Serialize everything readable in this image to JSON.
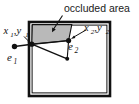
{
  "figure": {
    "title": "occluded area",
    "kind": "geometry-diagram",
    "width": 139,
    "height": 104
  },
  "colors": {
    "background": "#ffffff",
    "outline": "#111111",
    "box_stroke": "#111111",
    "occluded_fill": "#b9b9b9",
    "occluded_stroke": "#111111",
    "marker_fill": "#111111",
    "text": "#1a1a1a"
  },
  "annotations": {
    "callout": {
      "text": "occluded area",
      "points_to": "occluded-region"
    }
  },
  "labels": {
    "x1y1": {
      "base": "x",
      "sub1": "1",
      "mid": ",y",
      "sub2": "1",
      "full": "x1,y1"
    },
    "x2y2": {
      "base": "x",
      "sub1": "2",
      "mid": ",y",
      "sub2": "2",
      "full": "x2,y2"
    },
    "e1": {
      "base": "e",
      "sub": "1",
      "full": "e1"
    },
    "e2": {
      "base": "e",
      "sub": "2",
      "full": "e2"
    }
  },
  "points": {
    "e1": {
      "x": 14.5,
      "y": 46.5,
      "name": "e1-endpoint-marker"
    },
    "e2": {
      "x": 68.5,
      "y": 40.5,
      "name": "e2-endpoint-marker"
    },
    "v_left": {
      "x": 31.5,
      "y": 44.0,
      "name": "left-vertex-marker"
    },
    "v_bottom": {
      "x": 67.0,
      "y": 58.5,
      "name": "lower-vertex-marker"
    }
  },
  "shapes": {
    "outer_box": {
      "x": 29,
      "y": 22,
      "w": 81,
      "h": 74
    },
    "occluded_polygon": "31.5,44 32,23.5 72,23.5 68.5,40.5",
    "segments": [
      {
        "from": "e1",
        "to": "v_left",
        "name": "e1-to-left-vertex"
      },
      {
        "from": "v_left",
        "to": "e2",
        "name": "left-vertex-to-e2"
      },
      {
        "from": "v_left",
        "to": "v_bottom",
        "name": "left-vertex-to-lower-vertex"
      },
      {
        "from": "e2",
        "to": "v_bottom",
        "name": "e2-to-lower-vertex"
      }
    ]
  }
}
